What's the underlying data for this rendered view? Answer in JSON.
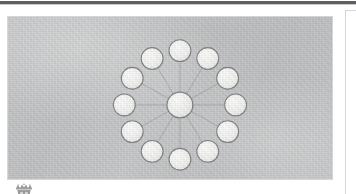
{
  "page": {
    "background_color": "#ffffff",
    "top_rule_color": "#5d5f62"
  },
  "figure": {
    "name": "hub-and-spoke-network-figure",
    "plate_color": "#c3c4c5",
    "border_color": "#d5d6d8",
    "node_fill": "#f2f2f1",
    "node_stroke": "#7d7e80",
    "spoke_color": "#8e8f91",
    "center_x": 180,
    "center_y": 99,
    "center_radius": 13,
    "outer_radius": 11,
    "ring_count": 12,
    "caption": ""
  },
  "chart_data": {
    "type": "scatter",
    "title": "",
    "xlabel": "",
    "ylabel": "",
    "nodes": [
      {
        "id": "hub",
        "label": "",
        "x": 180,
        "y": 99,
        "r": 13,
        "role": "center"
      },
      {
        "id": "n1",
        "label": "",
        "x": 180,
        "y": 44,
        "r": 11,
        "role": "outer"
      },
      {
        "id": "n2",
        "label": "",
        "x": 208,
        "y": 52,
        "r": 11,
        "role": "outer"
      },
      {
        "id": "n3",
        "label": "",
        "x": 228,
        "y": 72,
        "r": 11,
        "role": "outer"
      },
      {
        "id": "n4",
        "label": "",
        "x": 236,
        "y": 99,
        "r": 11,
        "role": "outer"
      },
      {
        "id": "n5",
        "label": "",
        "x": 228,
        "y": 126,
        "r": 11,
        "role": "outer"
      },
      {
        "id": "n6",
        "label": "",
        "x": 208,
        "y": 146,
        "r": 11,
        "role": "outer"
      },
      {
        "id": "n7",
        "label": "",
        "x": 180,
        "y": 154,
        "r": 11,
        "role": "outer"
      },
      {
        "id": "n8",
        "label": "",
        "x": 152,
        "y": 146,
        "r": 11,
        "role": "outer"
      },
      {
        "id": "n9",
        "label": "",
        "x": 132,
        "y": 126,
        "r": 11,
        "role": "outer"
      },
      {
        "id": "n10",
        "label": "",
        "x": 124,
        "y": 99,
        "r": 11,
        "role": "outer"
      },
      {
        "id": "n11",
        "label": "",
        "x": 132,
        "y": 72,
        "r": 11,
        "role": "outer"
      },
      {
        "id": "n12",
        "label": "",
        "x": 152,
        "y": 52,
        "r": 11,
        "role": "outer"
      }
    ],
    "edges": [
      {
        "from": "hub",
        "to": "n1"
      },
      {
        "from": "hub",
        "to": "n2"
      },
      {
        "from": "hub",
        "to": "n3"
      },
      {
        "from": "hub",
        "to": "n4"
      },
      {
        "from": "hub",
        "to": "n5"
      },
      {
        "from": "hub",
        "to": "n6"
      },
      {
        "from": "hub",
        "to": "n7"
      },
      {
        "from": "hub",
        "to": "n8"
      },
      {
        "from": "hub",
        "to": "n9"
      },
      {
        "from": "hub",
        "to": "n10"
      },
      {
        "from": "hub",
        "to": "n11"
      },
      {
        "from": "hub",
        "to": "n12"
      }
    ],
    "legend": [],
    "annotations": []
  },
  "emblem": {
    "name": "crest-emblem",
    "alt": "crest emblem"
  },
  "right_panel": {
    "name": "adjacent-page-panel"
  }
}
